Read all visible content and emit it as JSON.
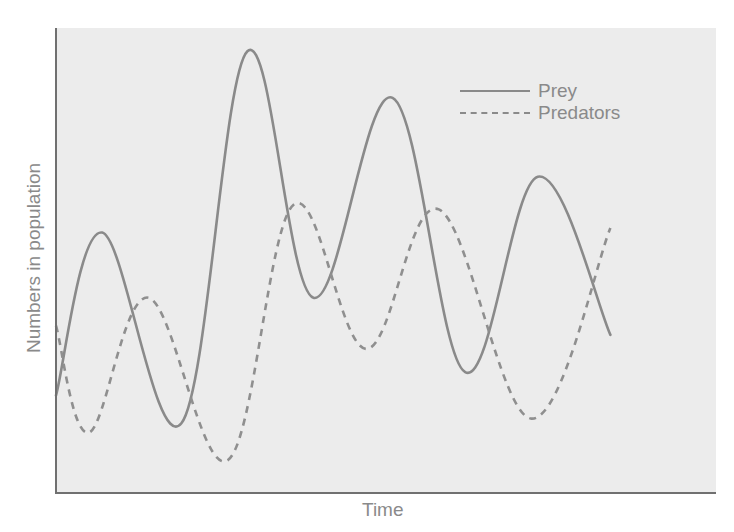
{
  "chart_data": {
    "type": "line",
    "title": "",
    "xlabel": "Time",
    "ylabel": "Numbers in population",
    "grid": false,
    "legend_position": "upper right",
    "x_ticks": [],
    "y_ticks": [],
    "note": "Values are relative (no numeric axes); y is height above x-axis in plot units 0-100, x is relative time 0-100",
    "series": [
      {
        "name": "Prey",
        "style": "solid",
        "color": "#8a8a8a",
        "points": [
          [
            0,
            21
          ],
          [
            7,
            56
          ],
          [
            19,
            15
          ],
          [
            29,
            95
          ],
          [
            39,
            42
          ],
          [
            51,
            85
          ],
          [
            62,
            26
          ],
          [
            73,
            68
          ],
          [
            84,
            34
          ]
        ]
      },
      {
        "name": "Predators",
        "style": "dashed",
        "color": "#8a8a8a",
        "points": [
          [
            0,
            36
          ],
          [
            5,
            13
          ],
          [
            14,
            42
          ],
          [
            26,
            7
          ],
          [
            36,
            62
          ],
          [
            47,
            31
          ],
          [
            58,
            61
          ],
          [
            72,
            16
          ],
          [
            84,
            57
          ]
        ]
      }
    ]
  },
  "legend": {
    "items": [
      {
        "label": "Prey"
      },
      {
        "label": "Predators"
      }
    ]
  },
  "axes": {
    "xlabel": "Time",
    "ylabel": "Numbers in population"
  }
}
